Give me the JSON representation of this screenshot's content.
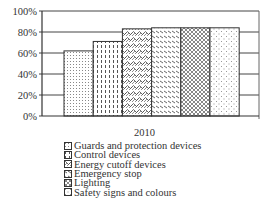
{
  "chart_data": {
    "type": "bar",
    "title": "",
    "xlabel": "",
    "ylabel": "",
    "categories": [
      "2010"
    ],
    "series": [
      {
        "name": "Guards and protection devices",
        "values": [
          62
        ],
        "pattern": "fine-dots"
      },
      {
        "name": "Control devices",
        "values": [
          71
        ],
        "pattern": "vertical-dashes"
      },
      {
        "name": "Energy cutoff devices",
        "values": [
          83
        ],
        "pattern": "scales"
      },
      {
        "name": "Emergency stop",
        "values": [
          84
        ],
        "pattern": "diagonal-dashes"
      },
      {
        "name": "Lighting",
        "values": [
          84
        ],
        "pattern": "crosshatch"
      },
      {
        "name": "Safety signs and colours",
        "values": [
          84
        ],
        "pattern": "sparse-dots"
      }
    ],
    "ylim": [
      0,
      100
    ],
    "yticks": [
      "0%",
      "20%",
      "40%",
      "60%",
      "80%",
      "100%"
    ],
    "grid": true,
    "legend_position": "bottom"
  },
  "x_category_label": "2010",
  "legend": [
    "Guards and protection devices",
    "Control devices",
    "Energy cutoff devices",
    "Emergency stop",
    "Lighting",
    "Safety signs and colours"
  ]
}
